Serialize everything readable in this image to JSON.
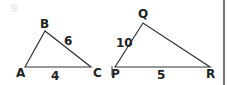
{
  "figure_label": "9",
  "triangle_abc": {
    "vertices": {
      "A": "A",
      "B": "B",
      "C": "C"
    },
    "side_bc": "6",
    "side_ac": "4"
  },
  "triangle_pqr": {
    "vertices": {
      "P": "P",
      "Q": "Q",
      "R": "R"
    },
    "side_pq": "10",
    "side_pr": "5"
  },
  "colors": {
    "stroke": "#333333",
    "text": "#222222",
    "faint": "#e6e6e6"
  }
}
